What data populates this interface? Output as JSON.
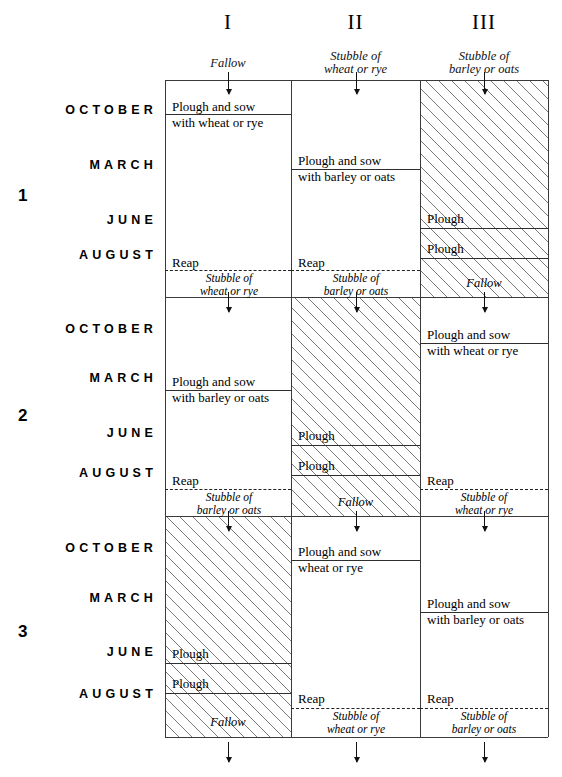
{
  "diagram": {
    "columns": [
      {
        "numeral": "I",
        "start_state_line1": "Fallow",
        "start_state_line2": ""
      },
      {
        "numeral": "II",
        "start_state_line1": "Stubble of",
        "start_state_line2": "wheat or rye"
      },
      {
        "numeral": "III",
        "start_state_line1": "Stubble of",
        "start_state_line2": "barley or oats"
      }
    ],
    "months": [
      "OCTOBER",
      "MARCH",
      "JUNE",
      "AUGUST"
    ],
    "years": [
      "1",
      "2",
      "3"
    ],
    "labels": {
      "plough": "Plough",
      "reap": "Reap",
      "fallow": "Fallow",
      "plough_sow": "Plough and sow",
      "with_wheat_or_rye": "with wheat or rye",
      "with_barley_or_oats": "with barley or oats",
      "wheat_or_rye": "wheat or rye",
      "stubble_of": "Stubble of",
      "stubble_wheat_rye": "wheat or rye",
      "stubble_barley_oats": "barley or oats"
    },
    "year1": {
      "col1": {
        "october_op_line1": "Plough and sow",
        "october_op_line2": "with wheat or rye",
        "august_reap": "Reap",
        "end_stubble_line1": "Stubble of",
        "end_stubble_line2": "wheat or rye"
      },
      "col2": {
        "march_op_line1": "Plough and sow",
        "march_op_line2": "with barley or oats",
        "august_reap": "Reap",
        "end_stubble_line1": "Stubble of",
        "end_stubble_line2": "barley or oats"
      },
      "col3": {
        "june_plough": "Plough",
        "august_plough": "Plough",
        "end_state": "Fallow"
      }
    },
    "year2": {
      "col1": {
        "march_op_line1": "Plough and sow",
        "march_op_line2": "with barley or oats",
        "august_reap": "Reap",
        "end_stubble_line1": "Stubble of",
        "end_stubble_line2": "barley or oats"
      },
      "col2": {
        "june_plough": "Plough",
        "august_plough": "Plough",
        "end_state": "Fallow"
      },
      "col3": {
        "october_op_line1": "Plough and sow",
        "october_op_line2": "with wheat or rye",
        "august_reap": "Reap",
        "end_stubble_line1": "Stubble of",
        "end_stubble_line2": "wheat or rye"
      }
    },
    "year3": {
      "col1": {
        "june_plough": "Plough",
        "august_plough": "Plough",
        "end_state": "Fallow"
      },
      "col2": {
        "october_op_line1": "Plough and sow",
        "october_op_line2": "wheat or rye",
        "august_reap": "Reap",
        "end_stubble_line1": "Stubble of",
        "end_stubble_line2": "wheat or rye"
      },
      "col3": {
        "march_op_line1": "Plough and sow",
        "march_op_line2": "with barley or oats",
        "august_reap": "Reap",
        "end_stubble_line1": "Stubble of",
        "end_stubble_line2": "barley or oats"
      }
    },
    "colors": {
      "ink": "#000000",
      "rule": "#3a3a3a",
      "hatch": "#282828",
      "background": "#ffffff"
    }
  }
}
